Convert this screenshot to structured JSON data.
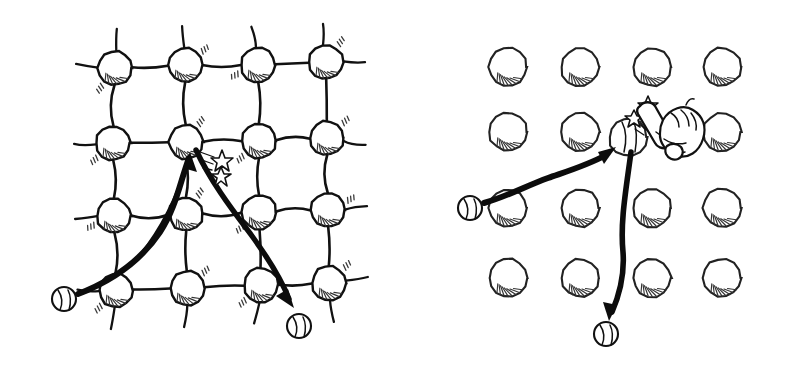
{
  "figure": {
    "background_color": "#ffffff",
    "ink_color": "#111111",
    "width": 786,
    "height": 368,
    "style": "hand-drawn sketch, black ink on white"
  },
  "panels": [
    {
      "id": "left-panel",
      "name": "bonded-lattice-panel",
      "description": "4 by 4 lattice of atoms joined by springy bonds with dangling edge stubs",
      "lattice": {
        "type": "bonded",
        "rows": 4,
        "cols": 4,
        "node_radius": 17,
        "bonds_drawn": true,
        "edge_stubs": true,
        "node_positions": [
          [
            115,
            68
          ],
          [
            185,
            65
          ],
          [
            258,
            65
          ],
          [
            326,
            62
          ],
          [
            113,
            143
          ],
          [
            186,
            142
          ],
          [
            259,
            141
          ],
          [
            327,
            138
          ],
          [
            114,
            216
          ],
          [
            186,
            214
          ],
          [
            259,
            212
          ],
          [
            328,
            210
          ],
          [
            116,
            290
          ],
          [
            187,
            288
          ],
          [
            261,
            285
          ],
          [
            329,
            283
          ]
        ],
        "impact_node_index": 5,
        "impact_node_position": [
          186,
          142
        ]
      },
      "incoming": {
        "name": "incoming-ball-trajectory",
        "ball_position": [
          64,
          299
        ],
        "ball_radius": 12,
        "arrow_tip": [
          190,
          155
        ],
        "stroke": "tapered thick-to-thin curve",
        "label": "incoming ball"
      },
      "outgoing": {
        "name": "outgoing-ball-trajectory",
        "ball_position": [
          299,
          326
        ],
        "ball_radius": 12,
        "arrow_tip": [
          292,
          305
        ],
        "stroke": "thick curve",
        "label": "scattered ball"
      },
      "impact": {
        "name": "impact-sparks",
        "stars": [
          [
            222,
            158
          ],
          [
            222,
            174
          ]
        ],
        "spark_lines": 3
      }
    },
    {
      "id": "right-panel",
      "name": "free-lattice-panel",
      "description": "4 by 4 grid of unconnected atoms; a fist swinging a bat strikes the atom",
      "lattice": {
        "type": "unbonded",
        "rows": 4,
        "cols": 4,
        "node_radius": 19,
        "bonds_drawn": false,
        "edge_stubs": false,
        "node_positions": [
          [
            508,
            67
          ],
          [
            580,
            67
          ],
          [
            652,
            67
          ],
          [
            722,
            67
          ],
          [
            508,
            132
          ],
          [
            580,
            132
          ],
          [
            628,
            137
          ],
          [
            722,
            132
          ],
          [
            508,
            208
          ],
          [
            580,
            208
          ],
          [
            652,
            208
          ],
          [
            722,
            208
          ],
          [
            508,
            278
          ],
          [
            580,
            278
          ],
          [
            652,
            278
          ],
          [
            722,
            278
          ]
        ],
        "struck_node_index": 6,
        "struck_node_position": [
          628,
          137
        ]
      },
      "incoming": {
        "name": "incoming-ball-trajectory",
        "ball_position": [
          470,
          208
        ],
        "ball_radius": 12,
        "arrow_tip": [
          612,
          150
        ],
        "stroke": "tapered thick-to-thin curve",
        "label": "incoming ball"
      },
      "outgoing": {
        "name": "outgoing-ball-trajectory",
        "ball_position": [
          606,
          334
        ],
        "ball_radius": 12,
        "arrow_tip": [
          612,
          313
        ],
        "stroke": "thick curve",
        "label": "scattered ball"
      },
      "impact": {
        "name": "impact-sparks",
        "stars": [
          [
            647,
            103
          ],
          [
            634,
            115
          ]
        ],
        "spark_lines": 3
      },
      "striker": {
        "name": "fist-with-bat",
        "bat_position": [
          645,
          120
        ],
        "fist_position": [
          672,
          133
        ],
        "description": "a clenched fist gripping a short bat/mallet, striking the atom"
      }
    }
  ]
}
